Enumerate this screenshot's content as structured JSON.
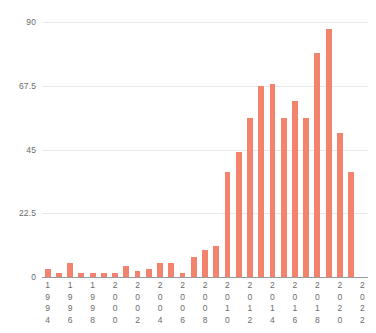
{
  "chart_data": {
    "type": "bar",
    "title": "",
    "subtitle": "",
    "xlabel": "",
    "ylabel": "",
    "categories": [
      "1994",
      "1995",
      "1996",
      "1997",
      "1998",
      "1999",
      "2000",
      "2001",
      "2002",
      "2003",
      "2004",
      "2005",
      "2006",
      "2007",
      "2008",
      "2009",
      "2010",
      "2011",
      "2012",
      "2013",
      "2014",
      "2015",
      "2016",
      "2017",
      "2018",
      "2019",
      "2020",
      "2021",
      "2022"
    ],
    "values": [
      3,
      1.5,
      5,
      1.5,
      1.5,
      1.5,
      1.5,
      4,
      2,
      3,
      5,
      5,
      1.5,
      7,
      9.5,
      11,
      37,
      44,
      56,
      67.5,
      68,
      56,
      62,
      56,
      79,
      87.5,
      51,
      37,
      0
    ],
    "bar_values_labeled": [
      {
        "year": "1994",
        "value": 3
      },
      {
        "year": "1995",
        "value": 1.5
      },
      {
        "year": "1996",
        "value": 5
      },
      {
        "year": "1997",
        "value": 1.5
      },
      {
        "year": "1998",
        "value": 1.5
      },
      {
        "year": "1999",
        "value": 1.5
      },
      {
        "year": "2000",
        "value": 1.5
      },
      {
        "year": "2001",
        "value": 4
      },
      {
        "year": "2002",
        "value": 2
      },
      {
        "year": "2003",
        "value": 3
      },
      {
        "year": "2004",
        "value": 5
      },
      {
        "year": "2005",
        "value": 5
      },
      {
        "year": "2006",
        "value": 1.5
      },
      {
        "year": "2007",
        "value": 7
      },
      {
        "year": "2008",
        "value": 9.5
      },
      {
        "year": "2009",
        "value": 11
      },
      {
        "year": "2010",
        "value": 37
      },
      {
        "year": "2011",
        "value": 44
      },
      {
        "year": "2012",
        "value": 56
      },
      {
        "year": "2013",
        "value": 67.5
      },
      {
        "year": "2014",
        "value": 68
      },
      {
        "year": "2015",
        "value": 56
      },
      {
        "year": "2016",
        "value": 62
      },
      {
        "year": "2017",
        "value": 56
      },
      {
        "year": "2018",
        "value": 79
      },
      {
        "year": "2019",
        "value": 87.5
      },
      {
        "year": "2020",
        "value": 51
      },
      {
        "year": "2021",
        "value": 37
      },
      {
        "year": "2022",
        "value": 0
      }
    ],
    "ylim": [
      0,
      90
    ],
    "yticks": [
      0,
      22.5,
      45,
      67.5,
      90
    ],
    "ytick_labels": [
      "0",
      "22.5",
      "45",
      "67.5",
      "90"
    ],
    "xtick_labels": [
      "1994",
      "1996",
      "1998",
      "2000",
      "2002",
      "2004",
      "2006",
      "2008",
      "2010",
      "2012",
      "2014",
      "2016",
      "2018",
      "2020",
      "2022"
    ],
    "xtick_indices": [
      0,
      2,
      4,
      6,
      8,
      10,
      12,
      14,
      16,
      18,
      20,
      22,
      24,
      26,
      28
    ],
    "grid": true,
    "grid_axis": "y",
    "legend": null,
    "legend_position": "none",
    "colors": {
      "bar": "#f4836e",
      "grid": "#e9e9e9",
      "axis": "#9a9a9a",
      "tick_text": "#6b6b6b",
      "background": "#ffffff"
    }
  }
}
